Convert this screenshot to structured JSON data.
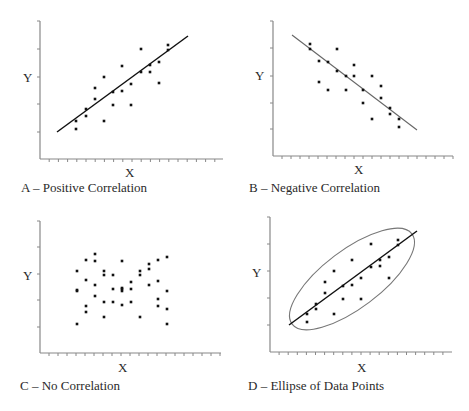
{
  "chart_data": [
    {
      "type": "scatter",
      "panel": "A",
      "title": "A – Positive Correlation",
      "xlabel": "X",
      "ylabel": "Y",
      "grid": false,
      "trend_line": {
        "from": [
          57,
          132
        ],
        "to": [
          188,
          36
        ],
        "color": "#111111"
      },
      "axis": {
        "x0": 40,
        "y0": 159,
        "top": 21,
        "right": 223,
        "yticks": [
          21,
          49,
          77,
          104,
          132
        ],
        "xtick_step": 9.2
      },
      "points": [
        [
          76,
          121
        ],
        [
          76,
          129
        ],
        [
          86,
          109
        ],
        [
          86,
          116
        ],
        [
          95,
          99
        ],
        [
          95,
          88
        ],
        [
          104,
          77
        ],
        [
          104,
          121
        ],
        [
          113,
          92
        ],
        [
          113,
          105
        ],
        [
          122,
          66
        ],
        [
          122,
          91
        ],
        [
          131,
          84
        ],
        [
          131,
          105
        ],
        [
          141,
          49
        ],
        [
          141,
          72
        ],
        [
          150,
          65
        ],
        [
          150,
          72
        ],
        [
          159,
          62
        ],
        [
          159,
          83
        ],
        [
          168,
          45
        ],
        [
          168,
          50
        ]
      ]
    },
    {
      "type": "scatter",
      "panel": "B",
      "title": "B – Negative Correlation",
      "xlabel": "X",
      "ylabel": "Y",
      "grid": false,
      "trend_line": {
        "from": [
          292,
          35
        ],
        "to": [
          417,
          130
        ],
        "color": "#666666"
      },
      "axis": {
        "x0": 273,
        "y0": 156,
        "top": 21,
        "right": 453,
        "yticks": [
          21,
          48,
          76,
          103,
          129
        ],
        "xtick_step": 9
      },
      "points": [
        [
          310,
          44
        ],
        [
          310,
          49
        ],
        [
          319,
          61
        ],
        [
          319,
          82
        ],
        [
          328,
          62
        ],
        [
          328,
          90
        ],
        [
          337,
          49
        ],
        [
          337,
          71
        ],
        [
          346,
          76
        ],
        [
          346,
          90
        ],
        [
          354,
          65
        ],
        [
          354,
          76
        ],
        [
          363,
          90
        ],
        [
          363,
          103
        ],
        [
          372,
          76
        ],
        [
          372,
          119
        ],
        [
          381,
          86
        ],
        [
          381,
          98
        ],
        [
          390,
          108
        ],
        [
          390,
          114
        ],
        [
          399,
          119
        ],
        [
          399,
          127
        ]
      ]
    },
    {
      "type": "scatter",
      "panel": "C",
      "title": "C – No Correlation",
      "xlabel": "X",
      "ylabel": "Y",
      "grid": false,
      "axis": {
        "x0": 40,
        "y0": 353,
        "top": 221,
        "right": 221,
        "yticks": [
          221,
          247,
          274,
          300,
          327
        ],
        "xtick_step": 9
      },
      "points": [
        [
          77,
          271
        ],
        [
          77,
          290
        ],
        [
          77,
          291
        ],
        [
          77,
          324
        ],
        [
          86,
          260
        ],
        [
          86,
          280
        ],
        [
          86,
          306
        ],
        [
          86,
          312
        ],
        [
          95,
          254
        ],
        [
          95,
          261
        ],
        [
          95,
          285
        ],
        [
          95,
          296
        ],
        [
          104,
          271
        ],
        [
          104,
          275
        ],
        [
          104,
          302
        ],
        [
          104,
          317
        ],
        [
          113,
          275
        ],
        [
          113,
          289
        ],
        [
          113,
          302
        ],
        [
          122,
          261
        ],
        [
          122,
          288
        ],
        [
          122,
          289
        ],
        [
          122,
          291
        ],
        [
          122,
          305
        ],
        [
          131,
          282
        ],
        [
          131,
          289
        ],
        [
          131,
          302
        ],
        [
          140,
          271
        ],
        [
          140,
          275
        ],
        [
          140,
          317
        ],
        [
          149,
          264
        ],
        [
          149,
          269
        ],
        [
          149,
          285
        ],
        [
          158,
          260
        ],
        [
          158,
          281
        ],
        [
          158,
          299
        ],
        [
          158,
          306
        ],
        [
          167,
          257
        ],
        [
          167,
          291
        ],
        [
          167,
          309
        ],
        [
          167,
          324
        ]
      ]
    },
    {
      "type": "scatter",
      "panel": "D",
      "title": "D – Ellipse of Data Points",
      "xlabel": "X",
      "ylabel": "Y",
      "grid": false,
      "trend_line": {
        "from": [
          289,
          325
        ],
        "to": [
          417,
          231
        ],
        "color": "#111111"
      },
      "ellipse": {
        "cx": 352,
        "cy": 279,
        "rx": 75,
        "ry": 29,
        "rotation": -37,
        "color": "#777777"
      },
      "axis": {
        "x0": 270,
        "y0": 352,
        "top": 217,
        "right": 452,
        "yticks": [
          217,
          244,
          271,
          298,
          325
        ],
        "xtick_step": 9.1
      },
      "points": [
        [
          307,
          314
        ],
        [
          307,
          322
        ],
        [
          316,
          304
        ],
        [
          316,
          309
        ],
        [
          325,
          293
        ],
        [
          325,
          282
        ],
        [
          334,
          271
        ],
        [
          334,
          314
        ],
        [
          343,
          286
        ],
        [
          343,
          299
        ],
        [
          352,
          260
        ],
        [
          352,
          285
        ],
        [
          361,
          278
        ],
        [
          361,
          299
        ],
        [
          371,
          244
        ],
        [
          371,
          267
        ],
        [
          380,
          260
        ],
        [
          380,
          266
        ],
        [
          389,
          257
        ],
        [
          389,
          278
        ],
        [
          398,
          240
        ],
        [
          398,
          245
        ]
      ]
    }
  ],
  "labels": {
    "a_title": "A – Positive Correlation",
    "b_title": "B – Negative Correlation",
    "c_title": "C – No Correlation",
    "d_title": "D – Ellipse of Data Points",
    "x": "X",
    "y": "Y"
  }
}
